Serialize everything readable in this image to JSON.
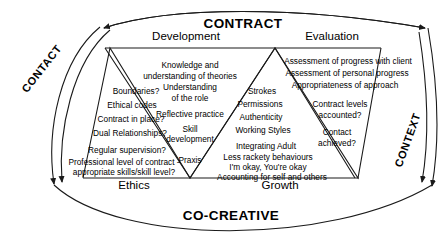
{
  "diagram": {
    "title_top": "CONTRACT",
    "title_bottom": "CO-CREATIVE",
    "left_axis_label": "CONTACT",
    "right_axis_label": "CONTEXT",
    "top_sections": [
      {
        "label": "Development"
      },
      {
        "label": "Evaluation"
      }
    ],
    "bottom_sections": [
      {
        "label": "Ethics"
      },
      {
        "label": "Growth"
      }
    ],
    "quadrants": [
      {
        "name": "ethics",
        "heading": "Ethics",
        "items": [
          "Boundaries?",
          "Ethical codes",
          "Contract in place?",
          "Dual Relationships?",
          "Regular supervision?",
          "Professional level of contract -",
          "appropriate skills/skill level?"
        ]
      },
      {
        "name": "development",
        "heading": "Development",
        "items": [
          "Knowledge and",
          "understanding of theories",
          "Understanding",
          "of the role",
          "Reflective practice",
          "Skill",
          "development",
          "Praxis"
        ]
      },
      {
        "name": "growth",
        "heading": "Growth",
        "items": [
          "Strokes",
          "Permissions",
          "Authenticity",
          "Working Styles",
          "Integrating Adult",
          "Less rackety behaviours",
          "I'm okay, You're okay",
          "Accounting for self and others"
        ]
      },
      {
        "name": "evaluation",
        "heading": "Evaluation",
        "items": [
          "Assessment of progress with client",
          "Assessment of personal progress",
          "Appropriateness of approach",
          "Contract levels",
          "accounted?",
          "Contact",
          "achieved?"
        ]
      }
    ],
    "colors": {
      "line": "#1a1a1a",
      "text": "#000000",
      "background": "#ffffff"
    }
  }
}
